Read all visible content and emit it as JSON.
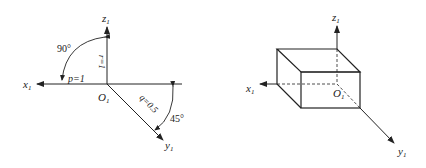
{
  "left_figure": {
    "axes": {
      "x": {
        "label": "x",
        "subscript": "1"
      },
      "y": {
        "label": "y",
        "subscript": "1"
      },
      "z": {
        "label": "z",
        "subscript": "1"
      }
    },
    "origin": {
      "label": "O",
      "subscript": "1"
    },
    "angles": {
      "xz": "90°",
      "xy": "45°"
    },
    "coefficients": {
      "p": "p=1",
      "q": "q=0.5",
      "r": "r=1"
    }
  },
  "right_figure": {
    "axes": {
      "x": {
        "label": "x",
        "subscript": "1"
      },
      "y": {
        "label": "y",
        "subscript": "1"
      },
      "z": {
        "label": "z",
        "subscript": "1"
      }
    },
    "origin": {
      "label": "O",
      "subscript": "1"
    },
    "shape": "oblique-cabinet-projection-box"
  },
  "colors": {
    "line": "#222222",
    "background": "#ffffff"
  }
}
